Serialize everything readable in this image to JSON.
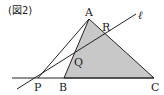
{
  "figure": {
    "caption": "(図2)",
    "line_label": "ℓ",
    "points": {
      "A": {
        "label": "A",
        "x": 89,
        "y": 19
      },
      "B": {
        "label": "B",
        "x": 64,
        "y": 78
      },
      "C": {
        "label": "C",
        "x": 154,
        "y": 78
      },
      "P": {
        "label": "P",
        "x": 38,
        "y": 78
      },
      "Q": {
        "label": "Q",
        "x": 74,
        "y": 55
      },
      "R": {
        "label": "R",
        "x": 106,
        "y": 35
      }
    },
    "colors": {
      "fill": "#c8c8c8",
      "stroke": "#222222",
      "background": "#ffffff"
    }
  }
}
